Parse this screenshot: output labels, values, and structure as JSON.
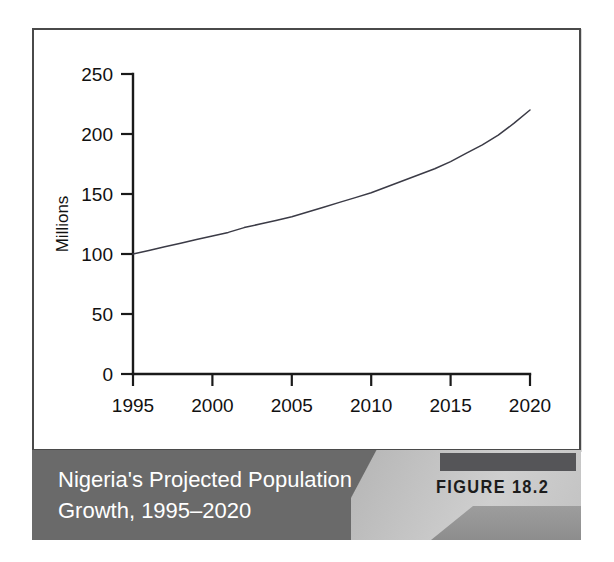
{
  "figure": {
    "number_label": "FIGURE 18.2",
    "caption_line1": "Nigeria's Projected Population",
    "caption_line2": "Growth, 1995–2020",
    "caption_full": "Nigeria's Projected Population Growth, 1995–2020",
    "caption_bg_color": "#6a6a6a",
    "caption_text_color": "#ffffff",
    "number_band_color": "#555558",
    "number_text_color": "#1c1c1c",
    "panel_border_color": "#4a4a4a"
  },
  "chart_data": {
    "type": "line",
    "title": "Nigeria's Projected Population Growth, 1995–2020",
    "xlabel": "",
    "ylabel": "Millions",
    "xlim": [
      1995,
      2020
    ],
    "ylim": [
      0,
      250
    ],
    "grid": false,
    "legend": false,
    "line_color": "#3b3b46",
    "x_ticks": [
      1995,
      2000,
      2005,
      2010,
      2015,
      2020
    ],
    "x_tick_labels": [
      "1995",
      "2000",
      "2005",
      "2010",
      "2015",
      "2020"
    ],
    "y_ticks": [
      0,
      50,
      100,
      150,
      200,
      250
    ],
    "y_tick_labels": [
      "0",
      "50",
      "100",
      "150",
      "200",
      "250"
    ],
    "x": [
      1995,
      1996,
      1997,
      1998,
      1999,
      2000,
      2001,
      2002,
      2003,
      2004,
      2005,
      2006,
      2007,
      2008,
      2009,
      2010,
      2011,
      2012,
      2013,
      2014,
      2015,
      2016,
      2017,
      2018,
      2019,
      2020
    ],
    "values": [
      100,
      103,
      106,
      109,
      112,
      115,
      118,
      122,
      125,
      128,
      131,
      135,
      139,
      143,
      147,
      151,
      156,
      161,
      166,
      171,
      177,
      184,
      191,
      199,
      209,
      220
    ],
    "series": [
      {
        "name": "Projected population (millions)",
        "values": [
          100,
          103,
          106,
          109,
          112,
          115,
          118,
          122,
          125,
          128,
          131,
          135,
          139,
          143,
          147,
          151,
          156,
          161,
          166,
          171,
          177,
          184,
          191,
          199,
          209,
          220
        ]
      }
    ],
    "annotations": []
  }
}
